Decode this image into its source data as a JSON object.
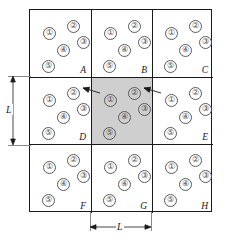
{
  "figure": {
    "grid": {
      "rows": 3,
      "columns": 3,
      "cells": [
        {
          "id": "cell-A",
          "label": "A",
          "row": 0,
          "column": 0,
          "shaded": false,
          "markers": [
            {
              "text": "①",
              "x": 18,
              "y": 22
            },
            {
              "text": "②",
              "x": 42,
              "y": 15
            },
            {
              "text": "③",
              "x": 52,
              "y": 31
            },
            {
              "text": "④",
              "x": 32,
              "y": 39
            },
            {
              "text": "⑤",
              "x": 17,
              "y": 55
            }
          ]
        },
        {
          "id": "cell-B",
          "label": "B",
          "row": 0,
          "column": 1,
          "shaded": false,
          "markers": [
            {
              "text": "①",
              "x": 18,
              "y": 22
            },
            {
              "text": "②",
              "x": 42,
              "y": 15
            },
            {
              "text": "③",
              "x": 52,
              "y": 31
            },
            {
              "text": "④",
              "x": 32,
              "y": 39
            },
            {
              "text": "⑤",
              "x": 17,
              "y": 55
            }
          ]
        },
        {
          "id": "cell-C",
          "label": "C",
          "row": 0,
          "column": 2,
          "shaded": false,
          "markers": [
            {
              "text": "①",
              "x": 18,
              "y": 22
            },
            {
              "text": "②",
              "x": 42,
              "y": 15
            },
            {
              "text": "③",
              "x": 52,
              "y": 31
            },
            {
              "text": "④",
              "x": 32,
              "y": 39
            },
            {
              "text": "⑤",
              "x": 17,
              "y": 55
            }
          ]
        },
        {
          "id": "cell-D",
          "label": "D",
          "row": 1,
          "column": 0,
          "shaded": false,
          "markers": [
            {
              "text": "①",
              "x": 18,
              "y": 22
            },
            {
              "text": "②",
              "x": 42,
              "y": 15
            },
            {
              "text": "③",
              "x": 52,
              "y": 31
            },
            {
              "text": "④",
              "x": 32,
              "y": 39
            },
            {
              "text": "⑤",
              "x": 17,
              "y": 55
            }
          ]
        },
        {
          "id": "cell-center",
          "label": "",
          "row": 1,
          "column": 1,
          "shaded": true,
          "markers": [
            {
              "text": "①",
              "x": 18,
              "y": 22
            },
            {
              "text": "②",
              "x": 42,
              "y": 15
            },
            {
              "text": "③",
              "x": 52,
              "y": 31
            },
            {
              "text": "④",
              "x": 32,
              "y": 39
            },
            {
              "text": "⑤",
              "x": 17,
              "y": 55
            }
          ]
        },
        {
          "id": "cell-E",
          "label": "E",
          "row": 1,
          "column": 2,
          "shaded": false,
          "markers": [
            {
              "text": "①",
              "x": 18,
              "y": 22
            },
            {
              "text": "②",
              "x": 42,
              "y": 15
            },
            {
              "text": "③",
              "x": 52,
              "y": 31
            },
            {
              "text": "④",
              "x": 32,
              "y": 39
            },
            {
              "text": "⑤",
              "x": 17,
              "y": 55
            }
          ]
        },
        {
          "id": "cell-F",
          "label": "F",
          "row": 2,
          "column": 0,
          "shaded": false,
          "markers": [
            {
              "text": "①",
              "x": 18,
              "y": 22
            },
            {
              "text": "②",
              "x": 42,
              "y": 15
            },
            {
              "text": "③",
              "x": 52,
              "y": 31
            },
            {
              "text": "④",
              "x": 32,
              "y": 39
            },
            {
              "text": "⑤",
              "x": 17,
              "y": 55
            }
          ]
        },
        {
          "id": "cell-G",
          "label": "G",
          "row": 2,
          "column": 1,
          "shaded": false,
          "markers": [
            {
              "text": "①",
              "x": 18,
              "y": 22
            },
            {
              "text": "②",
              "x": 42,
              "y": 15
            },
            {
              "text": "③",
              "x": 52,
              "y": 31
            },
            {
              "text": "④",
              "x": 32,
              "y": 39
            },
            {
              "text": "⑤",
              "x": 17,
              "y": 55
            }
          ]
        },
        {
          "id": "cell-H",
          "label": "H",
          "row": 2,
          "column": 2,
          "shaded": false,
          "markers": [
            {
              "text": "①",
              "x": 18,
              "y": 22
            },
            {
              "text": "②",
              "x": 42,
              "y": 15
            },
            {
              "text": "③",
              "x": 52,
              "y": 31
            },
            {
              "text": "④",
              "x": 32,
              "y": 39
            },
            {
              "text": "⑤",
              "x": 17,
              "y": 55
            }
          ]
        }
      ]
    },
    "dimensions": {
      "vertical_label": "L",
      "horizontal_label": "L"
    },
    "annotations": {
      "left_arrow": "arrow pointing from center cell marker 1 to left cell marker 3",
      "right_arrow": "arrow pointing from right cell marker 1 to center cell marker 3"
    },
    "colors": {
      "shaded_cell": "#cfcfcf",
      "line": "#1a1a1a",
      "marker": "#5a5a5a",
      "dimension": "#8a8a8a"
    }
  }
}
